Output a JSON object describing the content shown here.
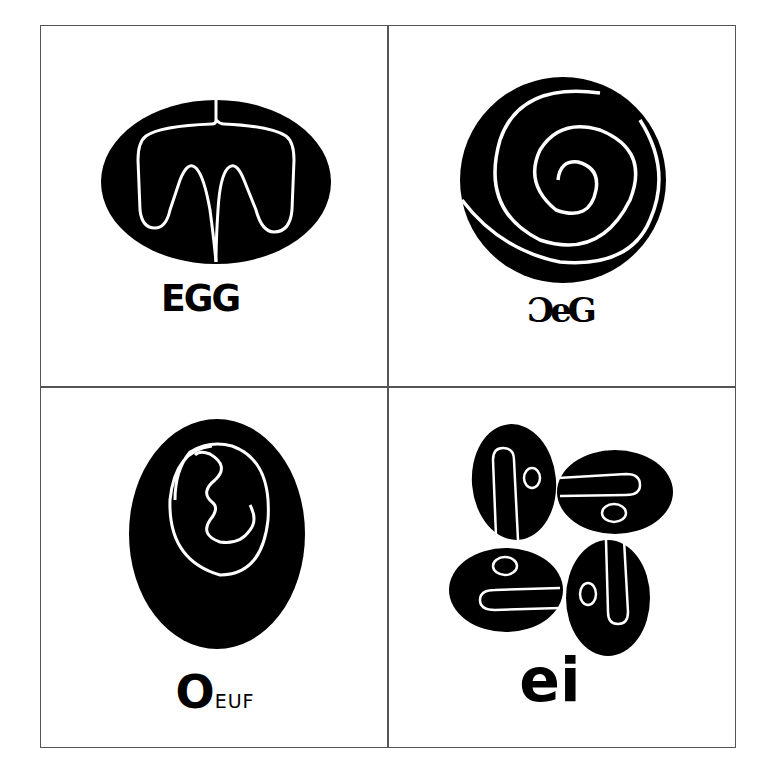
{
  "panels": [
    {
      "id": "english",
      "label": "EGG"
    },
    {
      "id": "ornamental",
      "label": "ƆeG"
    },
    {
      "id": "french",
      "label_big": "O",
      "label_small": "EUF"
    },
    {
      "id": "german",
      "label": "ei"
    }
  ],
  "colors": {
    "ink": "#000000",
    "paper": "#ffffff",
    "frame": "#555555"
  }
}
